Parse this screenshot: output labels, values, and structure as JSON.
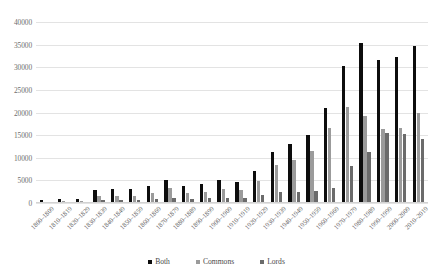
{
  "chart_data": {
    "type": "bar",
    "title": "",
    "xlabel": "",
    "ylabel": "",
    "ylim": [
      0,
      40000
    ],
    "yticks": [
      0,
      5000,
      10000,
      15000,
      20000,
      25000,
      30000,
      35000,
      40000
    ],
    "grid": true,
    "legend_position": "bottom-center",
    "categories": [
      "1800–1809",
      "1810–1819",
      "1820–1829",
      "1830–1839",
      "1840–1849",
      "1850–1859",
      "1860–1869",
      "1870–1879",
      "1880–1889",
      "1890–1899",
      "1900–1909",
      "1910–1919",
      "1920–1929",
      "1930–1939",
      "1940–1949",
      "1950–1959",
      "1960–1969",
      "1970–1979",
      "1980–1989",
      "1990–1999",
      "2000–2009",
      "2010–2019"
    ],
    "series": [
      {
        "name": "Both",
        "color": "#0d0d0d",
        "values": [
          700,
          800,
          900,
          2900,
          3100,
          3000,
          3700,
          5100,
          3700,
          4300,
          5000,
          4600,
          7000,
          11200,
          13000,
          15000,
          21000,
          30200,
          35400,
          31500,
          32300,
          34700
        ]
      },
      {
        "name": "Commons",
        "color": "#9b9b9b",
        "values": [
          300,
          350,
          400,
          1500,
          1500,
          1600,
          2300,
          3300,
          2200,
          2500,
          3100,
          2800,
          4900,
          8300,
          9600,
          11500,
          16500,
          21200,
          19300,
          16400,
          16600,
          20000
        ]
      },
      {
        "name": "Lords",
        "color": "#6b6b6b",
        "values": [
          260,
          280,
          300,
          600,
          600,
          620,
          800,
          1100,
          900,
          1000,
          1200,
          1100,
          1700,
          2400,
          2400,
          2700,
          3300,
          8200,
          11200,
          15500,
          15200,
          14200
        ]
      }
    ]
  }
}
